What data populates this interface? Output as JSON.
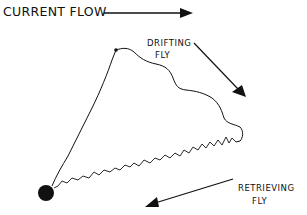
{
  "diagram": {
    "type": "fly-fishing drift path illustration",
    "labels": {
      "current_flow": "CURRENT FLOW",
      "drifting_line1": "DRIFTING",
      "drifting_line2": "FLY",
      "retrieving_line1": "RETRIEVING",
      "retrieving_line2": "FLY"
    },
    "elements": {
      "current_arrow": {
        "from": [
          104,
          13
        ],
        "to": [
          193,
          13
        ],
        "direction": "right"
      },
      "drifting_arrow": {
        "from": [
          194,
          43
        ],
        "to": [
          246,
          97
        ],
        "direction": "down-right"
      },
      "retrieving_arrow": {
        "from": [
          233,
          179
        ],
        "to": [
          145,
          207
        ],
        "direction": "down-left"
      },
      "angler_dot": {
        "center": [
          46,
          193
        ],
        "radius": 8
      },
      "cast_point": {
        "center": [
          116,
          50
        ]
      }
    },
    "colors": {
      "ink": "#111111",
      "background": "#ffffff"
    }
  }
}
